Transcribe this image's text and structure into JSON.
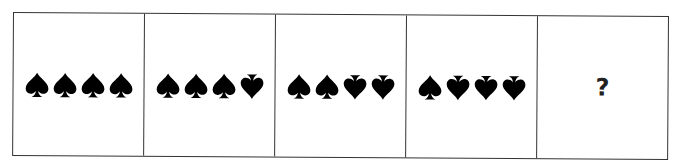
{
  "puzzle": {
    "cells": [
      {
        "symbols": [
          "spade-up",
          "spade-up",
          "spade-up",
          "spade-up"
        ]
      },
      {
        "symbols": [
          "spade-up",
          "spade-up",
          "spade-up",
          "spade-down"
        ]
      },
      {
        "symbols": [
          "spade-up",
          "spade-up",
          "spade-down",
          "spade-down"
        ]
      },
      {
        "symbols": [
          "spade-up",
          "spade-down",
          "spade-down",
          "spade-down"
        ]
      },
      {
        "answer": "?"
      }
    ],
    "colors": {
      "symbol": "#000000",
      "border": "#333333",
      "background": "#ffffff"
    }
  }
}
